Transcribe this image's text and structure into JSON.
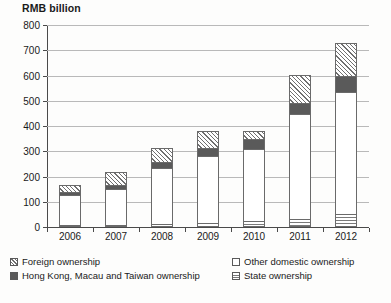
{
  "chart_data": {
    "type": "bar",
    "title": "RMB billion",
    "xlabel": "",
    "ylabel": "RMB billion",
    "ylim": [
      0,
      800
    ],
    "yticks": [
      0,
      100,
      200,
      300,
      400,
      500,
      600,
      700,
      800
    ],
    "grid": true,
    "stacked": true,
    "legend_position": "bottom",
    "categories": [
      "2006",
      "2007",
      "2008",
      "2009",
      "2010",
      "2011",
      "2012"
    ],
    "series": [
      {
        "name": "State ownership",
        "key": "state",
        "swatch": "horizontal-stripes",
        "values": [
          4,
          6,
          12,
          17,
          22,
          33,
          50
        ]
      },
      {
        "name": "Other domestic ownership",
        "key": "other",
        "swatch": "dotted",
        "values": [
          117,
          144,
          223,
          263,
          288,
          415,
          483
        ]
      },
      {
        "name": "Hong Kong, Macau and Taiwan ownership",
        "key": "hkmt",
        "swatch": "solid-dark-grey",
        "values": [
          12,
          14,
          22,
          32,
          37,
          45,
          66
        ]
      },
      {
        "name": "Foreign ownership",
        "key": "foreign",
        "swatch": "diagonal-hatch",
        "values": [
          28,
          51,
          55,
          70,
          35,
          110,
          128
        ]
      }
    ],
    "totals": [
      161,
      215,
      312,
      382,
      382,
      603,
      727
    ]
  },
  "legend": {
    "rows": [
      [
        {
          "label": "Foreign ownership",
          "key": "foreign"
        },
        {
          "label": "Other domestic ownership",
          "key": "other"
        }
      ],
      [
        {
          "label": "Hong Kong, Macau and Taiwan ownership",
          "key": "hkmt"
        },
        {
          "label": "State ownership",
          "key": "state"
        }
      ]
    ]
  },
  "caption_remnant": ""
}
